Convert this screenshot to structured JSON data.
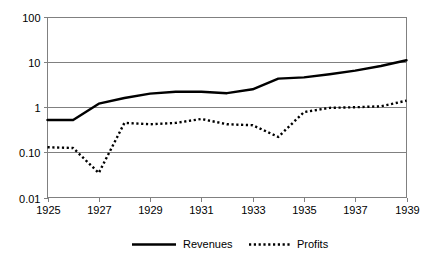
{
  "chart_data": {
    "type": "line",
    "title": "",
    "xlabel": "",
    "ylabel": "",
    "x": [
      1925,
      1926,
      1927,
      1928,
      1929,
      1930,
      1931,
      1932,
      1933,
      1934,
      1935,
      1936,
      1937,
      1938,
      1939
    ],
    "xtick_labels": [
      "1925",
      "1927",
      "1929",
      "1931",
      "1933",
      "1935",
      "1937",
      "1939"
    ],
    "xtick_values": [
      1925,
      1927,
      1929,
      1931,
      1933,
      1935,
      1937,
      1939
    ],
    "xlim": [
      1925,
      1939
    ],
    "yscale": "log",
    "ylim": [
      0.01,
      100
    ],
    "ytick_labels": [
      "100",
      "10",
      "1",
      "0.10",
      "0.01"
    ],
    "ytick_values": [
      100,
      10,
      1,
      0.1,
      0.01
    ],
    "grid": true,
    "grid_axis": "y",
    "legend_position": "bottom",
    "series": [
      {
        "name": "Revenues",
        "style": "solid",
        "color": "#000000",
        "values": [
          0.52,
          0.52,
          1.2,
          1.6,
          2.0,
          2.2,
          2.2,
          2.05,
          2.5,
          4.3,
          4.6,
          5.4,
          6.5,
          8.2,
          11.0
        ]
      },
      {
        "name": "Profits",
        "style": "dotted",
        "color": "#000000",
        "values": [
          0.13,
          0.125,
          0.035,
          0.45,
          0.42,
          0.45,
          0.55,
          0.42,
          0.4,
          0.22,
          0.78,
          0.97,
          1.0,
          1.05,
          1.4
        ]
      }
    ]
  },
  "legend": {
    "items": [
      {
        "label": "Revenues",
        "style": "solid"
      },
      {
        "label": "Profits",
        "style": "dotted"
      }
    ]
  },
  "axes": {
    "y_labels": [
      "100",
      "10",
      "1",
      "0.10",
      "0.01"
    ],
    "x_labels": [
      "1925",
      "1927",
      "1929",
      "1931",
      "1933",
      "1935",
      "1937",
      "1939"
    ]
  },
  "colors": {
    "series": "#000000",
    "grid": "#808080",
    "background": "#ffffff"
  }
}
